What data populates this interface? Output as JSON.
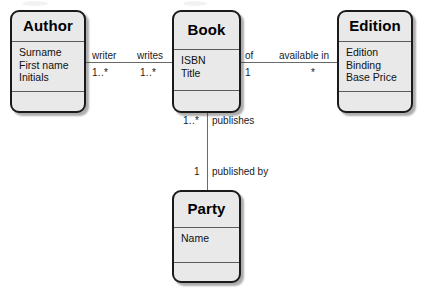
{
  "diagram": {
    "type": "uml-class-diagram",
    "title": "",
    "background_color": "#ffffff",
    "box_fill_color": "#e9e9e9",
    "box_border_color": "#1a1a1a",
    "line_color": "#6a6a6a",
    "classes": [
      {
        "id": "author",
        "name": "Author",
        "attributes": [
          "Surname",
          "First name",
          "Initials"
        ],
        "operations": []
      },
      {
        "id": "book",
        "name": "Book",
        "attributes": [
          "ISBN",
          "Title"
        ],
        "operations": []
      },
      {
        "id": "edition",
        "name": "Edition",
        "attributes": [
          "Edition",
          "Binding",
          "Base Price"
        ],
        "operations": []
      },
      {
        "id": "party",
        "name": "Party",
        "attributes": [
          "Name"
        ],
        "operations": []
      }
    ],
    "associations": [
      {
        "id": "author-book",
        "from": "Author",
        "to": "Book",
        "from_role": "writer",
        "from_multiplicity": "1..*",
        "to_role": "writes",
        "to_multiplicity": "1..*"
      },
      {
        "id": "book-edition",
        "from": "Book",
        "to": "Edition",
        "from_role": "of",
        "from_multiplicity": "1",
        "to_role": "available in",
        "to_multiplicity": "*"
      },
      {
        "id": "book-party",
        "from": "Book",
        "to": "Party",
        "from_role": "publishes",
        "from_multiplicity": "1..*",
        "to_role": "published by",
        "to_multiplicity": "1"
      }
    ]
  }
}
